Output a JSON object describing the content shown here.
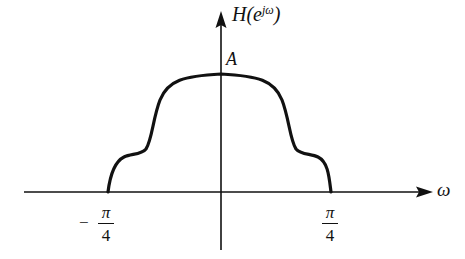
{
  "diagram": {
    "title": "",
    "colors": {
      "background": "#ffffff",
      "stroke": "#111111"
    },
    "axes": {
      "y_axis": {
        "label_main": "H(e",
        "label_sup": "jω",
        "label_close": ")"
      },
      "x_axis": {
        "label": "ω"
      }
    },
    "annotations": {
      "peak_label": "A"
    },
    "ticks": [
      {
        "sign": "−",
        "numerator": "π",
        "denominator": "4",
        "position": "left"
      },
      {
        "sign": "",
        "numerator": "π",
        "denominator": "4",
        "position": "right"
      }
    ],
    "curve": {
      "description": "Symmetric lowpass magnitude response with shoulders, zero outside |ω| > π/4, peak value A at ω = 0",
      "support": [
        "-π/4",
        "π/4"
      ],
      "peak": "A"
    }
  }
}
